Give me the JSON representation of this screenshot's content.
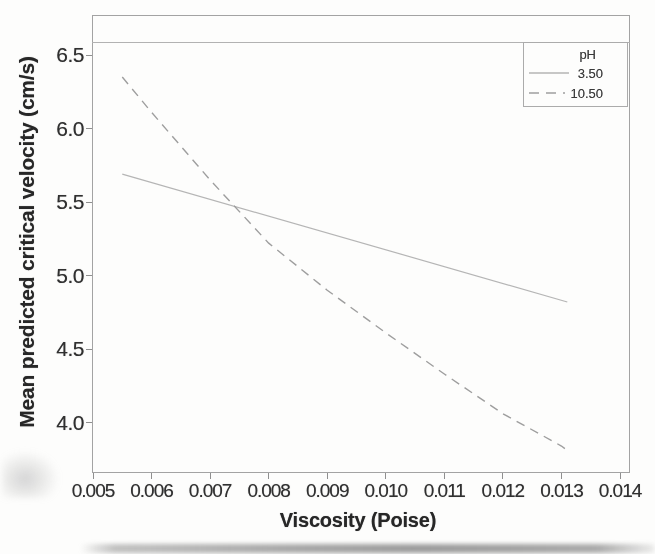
{
  "chart_data": {
    "type": "line",
    "title": "",
    "xlabel": "Viscosity (Poise)",
    "ylabel": "Mean predicted critical velocity (cm/s)",
    "xlim": [
      0.005,
      0.014
    ],
    "ylim": [
      3.68,
      6.78
    ],
    "grid": false,
    "legend": {
      "title": "pH",
      "position": "top-right"
    },
    "x_ticks": [
      "0.005",
      "0.006",
      "0.007",
      "0.008",
      "0.009",
      "0.010",
      "0.011",
      "0.012",
      "0.013",
      "0.014"
    ],
    "y_ticks": [
      "4.0",
      "4.5",
      "5.0",
      "5.5",
      "6.0",
      "6.5"
    ],
    "series": [
      {
        "name": "3.50",
        "line_style": "solid",
        "color": "#b5b5b5",
        "x": [
          0.0055,
          0.0131
        ],
        "y": [
          5.69,
          4.82
        ]
      },
      {
        "name": "10.50",
        "line_style": "dashed",
        "color": "#9e9e9e",
        "x": [
          0.0055,
          0.006,
          0.007,
          0.008,
          0.009,
          0.01,
          0.011,
          0.012,
          0.013,
          0.0131
        ],
        "y": [
          6.35,
          6.11,
          5.65,
          5.22,
          4.9,
          4.61,
          4.33,
          4.06,
          3.84,
          3.81
        ]
      }
    ]
  }
}
